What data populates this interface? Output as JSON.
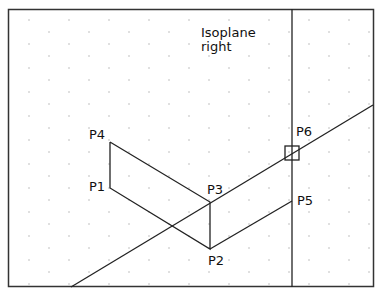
{
  "diagram": {
    "annotation": [
      "Isoplane",
      "right"
    ],
    "points": [
      {
        "id": "P1",
        "label": "P1",
        "x": 110,
        "y": 188
      },
      {
        "id": "P2",
        "label": "P2",
        "x": 210,
        "y": 249
      },
      {
        "id": "P3",
        "label": "P3",
        "x": 210,
        "y": 202
      },
      {
        "id": "P4",
        "label": "P4",
        "x": 110,
        "y": 142
      },
      {
        "id": "P5",
        "label": "P5",
        "x": 292,
        "y": 201
      },
      {
        "id": "P6",
        "label": "P6",
        "x": 292,
        "y": 153
      }
    ],
    "colors": {
      "line": "#222222",
      "grid_dot": "#b8b8b8",
      "background": "#ffffff"
    }
  }
}
